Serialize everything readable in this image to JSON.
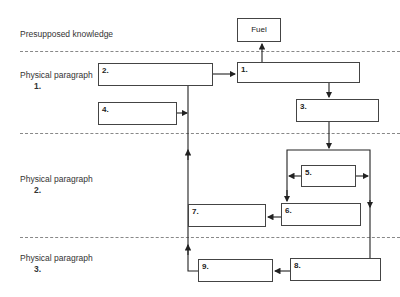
{
  "sections": [
    {
      "id": "presupposed",
      "label": "Presupposed knowledge",
      "number": ""
    },
    {
      "id": "pp1",
      "label": "Physical paragraph",
      "number": "1."
    },
    {
      "id": "pp2",
      "label": "Physical paragraph",
      "number": "2."
    },
    {
      "id": "pp3",
      "label": "Physical paragraph",
      "number": "3."
    }
  ],
  "boxes": {
    "fuel": "Fuel",
    "b1": "1.",
    "b2": "2.",
    "b3": "3.",
    "b4": "4.",
    "b5": "5.",
    "b6": "6.",
    "b7": "7.",
    "b8": "8.",
    "b9": "9."
  },
  "edges": [
    [
      "1",
      "Fuel"
    ],
    [
      "2",
      "1"
    ],
    [
      "4",
      "2-line"
    ],
    [
      "1",
      "3"
    ],
    [
      "3",
      "bracket"
    ],
    [
      "5",
      "6-branch"
    ],
    [
      "5",
      "8-branch"
    ],
    [
      "6",
      "7"
    ],
    [
      "8",
      "9"
    ],
    [
      "9",
      "7"
    ],
    [
      "7",
      "2"
    ]
  ],
  "colors": {
    "line": "#222222",
    "dash": "#888888"
  }
}
